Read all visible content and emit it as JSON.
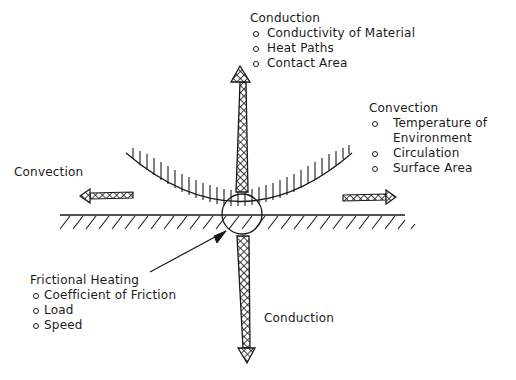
{
  "labels": {
    "conduction_top": {
      "title": "Conduction",
      "items": [
        "Conductivity of Material",
        "Heat Paths",
        "Contact Area"
      ]
    },
    "convection_right": {
      "title": "Convection",
      "items": [
        "Temperature of",
        "Environment",
        "Circulation",
        "Surface Area"
      ]
    },
    "convection_left": {
      "title": "Convection"
    },
    "frictional_heating": {
      "title": "Frictional Heating",
      "items": [
        "Coefficient of Friction",
        "Load",
        "Speed"
      ]
    },
    "conduction_bottom": {
      "title": "Conduction"
    }
  },
  "colors": {
    "ink": "#1a1a1a",
    "background": "#ffffff"
  }
}
